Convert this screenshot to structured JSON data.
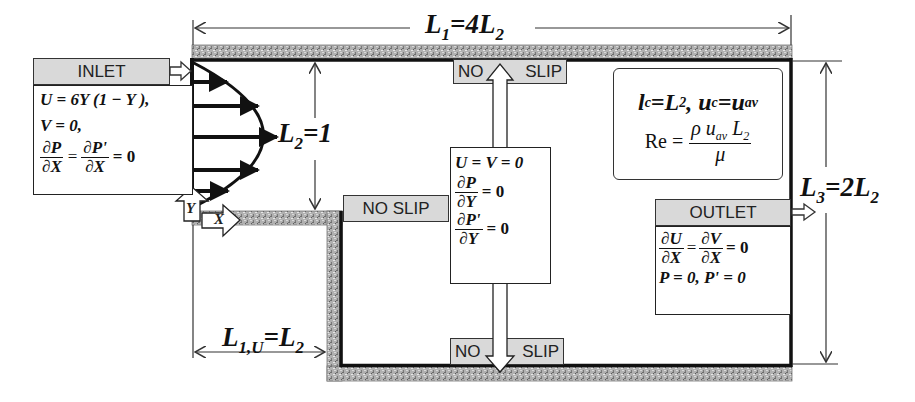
{
  "diagram": {
    "type": "backward-facing step channel flow schematic",
    "dimensions": {
      "L1": {
        "label_main": "L",
        "label_sub": "1",
        "label_rest": "=4L",
        "label_rest_sub": "2"
      },
      "L2": {
        "label_main": "L",
        "label_sub": "2",
        "label_rest": "=1"
      },
      "L3": {
        "label_main": "L",
        "label_sub": "3",
        "label_rest": "=2L",
        "label_rest_sub": "2"
      },
      "L1U": {
        "label_main": "L",
        "label_sub": "1,U",
        "label_rest": "=L",
        "label_rest_sub": "2"
      }
    },
    "inlet": {
      "label": "INLET",
      "eq1": "U = 6Y (1 − Y ),",
      "eq2": "V = 0,",
      "eq3_num_a": "∂P",
      "eq3_den_a": "∂X",
      "eq3_eq": "=",
      "eq3_num_b": "∂P'",
      "eq3_den_b": "∂X",
      "eq3_tail": "= 0"
    },
    "wall_conditions": {
      "top_label_left": "NO",
      "top_label_right": "SLIP",
      "bottom_label_left": "NO",
      "bottom_label_right": "SLIP",
      "step_label": "NO SLIP",
      "eq1": "U = V = 0",
      "eq2_num": "∂P",
      "eq2_den": "∂Y",
      "eq2_tail": "= 0",
      "eq3_num": "∂P'",
      "eq3_den": "∂Y",
      "eq3_tail": "= 0"
    },
    "outlet": {
      "label": "OUTLET",
      "eq1_num_a": "∂U",
      "eq1_den_a": "∂X",
      "eq1_eq": "=",
      "eq1_num_b": "∂V",
      "eq1_den_b": "∂X",
      "eq1_tail": "= 0",
      "eq2": "P = 0, P' = 0"
    },
    "scales": {
      "line1_a": "l",
      "line1_a_sub": "c",
      "line1_b": "=L",
      "line1_b_sub": "2",
      "line1_c": ", u",
      "line1_c_sub": "c",
      "line1_d": "=u",
      "line1_d_sub": "av",
      "re_lhs": "Re =",
      "re_num": "ρ u",
      "re_num_sub": "av",
      "re_num_tail": " L",
      "re_num_tail_sub": "2",
      "re_den": "μ"
    },
    "axes": {
      "x": "X",
      "y": "Y"
    },
    "colors": {
      "wall_hatch": "#9a9a9a",
      "label_fill": "#d9d9d9",
      "line": "#111111"
    }
  }
}
